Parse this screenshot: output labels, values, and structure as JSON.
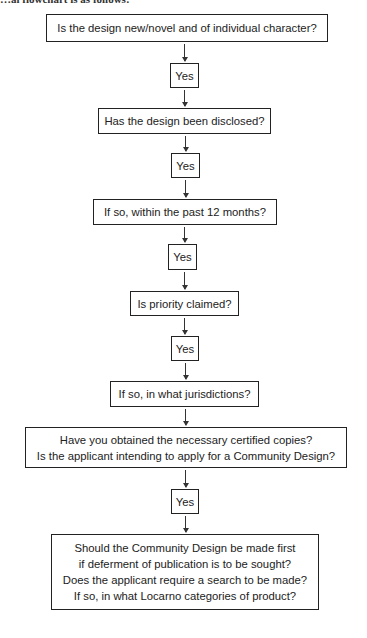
{
  "intro_text": "…al flowchart is as follows:",
  "flowchart": {
    "nodes": [
      {
        "id": "q1",
        "type": "question",
        "lines": [
          "Is the design new/novel and of individual character?"
        ]
      },
      {
        "id": "a1",
        "type": "answer",
        "lines": [
          "Yes"
        ]
      },
      {
        "id": "q2",
        "type": "question",
        "lines": [
          "Has the design been disclosed?"
        ]
      },
      {
        "id": "a2",
        "type": "answer",
        "lines": [
          "Yes"
        ]
      },
      {
        "id": "q3",
        "type": "question",
        "lines": [
          "If so, within the past 12 months?"
        ]
      },
      {
        "id": "a3",
        "type": "answer",
        "lines": [
          "Yes"
        ]
      },
      {
        "id": "q4",
        "type": "question",
        "lines": [
          "Is priority claimed?"
        ]
      },
      {
        "id": "a4",
        "type": "answer",
        "lines": [
          "Yes"
        ]
      },
      {
        "id": "q5",
        "type": "question",
        "lines": [
          "If so, in what jurisdictions?"
        ]
      },
      {
        "id": "q6",
        "type": "question",
        "lines": [
          "Have you obtained the necessary certified copies?",
          "Is the applicant intending to apply for a Community Design?"
        ]
      },
      {
        "id": "a5",
        "type": "answer",
        "lines": [
          "Yes"
        ]
      },
      {
        "id": "q7",
        "type": "question",
        "lines": [
          "Should the Community Design be made first",
          "if deferment of publication is to be sought?",
          "Does the applicant require a search to be made?",
          "If so, in what Locarno categories of product?"
        ]
      }
    ],
    "edges": [
      [
        "q1",
        "a1"
      ],
      [
        "a1",
        "q2"
      ],
      [
        "q2",
        "a2"
      ],
      [
        "a2",
        "q3"
      ],
      [
        "q3",
        "a3"
      ],
      [
        "a3",
        "q4"
      ],
      [
        "q4",
        "a4"
      ],
      [
        "a4",
        "q5"
      ],
      [
        "q5",
        "q6"
      ],
      [
        "q6",
        "a5"
      ],
      [
        "a5",
        "q7"
      ]
    ],
    "colors": {
      "border": "#222222",
      "background": "#ffffff",
      "text": "#222222"
    }
  }
}
